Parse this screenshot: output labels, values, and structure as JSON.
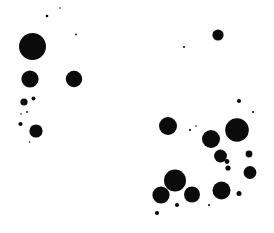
{
  "canvas": {
    "width": 274,
    "height": 233,
    "background_color": "#ffffff",
    "dot_color": "#0b0b0b"
  },
  "chart_data": {
    "type": "scatter",
    "title": "",
    "subtitle": "",
    "xlabel": "",
    "ylabel": "",
    "xlim": [
      0,
      274
    ],
    "ylim": [
      0,
      233
    ],
    "grid": false,
    "axes_visible": false,
    "tick_labels_x": [],
    "tick_labels_y": [],
    "legend": [],
    "annotations": [],
    "marker": "circle-filled",
    "marker_color": "#0b0b0b",
    "background_color": "#ffffff",
    "point_count": 35,
    "size_encoding": "radius_pixels",
    "series": [
      {
        "name": "dots",
        "color": "#0b0b0b",
        "points": [
          {
            "x": 32.5,
            "y": 46.5,
            "r": 13.5
          },
          {
            "x": 30.0,
            "y": 79.0,
            "r": 8.6
          },
          {
            "x": 74.0,
            "y": 79.0,
            "r": 8.2
          },
          {
            "x": 24.0,
            "y": 102.0,
            "r": 3.6
          },
          {
            "x": 33.5,
            "y": 98.5,
            "r": 2.0
          },
          {
            "x": 27.0,
            "y": 112.0,
            "r": 0.9
          },
          {
            "x": 21.0,
            "y": 114.0,
            "r": 0.8
          },
          {
            "x": 20.5,
            "y": 124.0,
            "r": 2.1
          },
          {
            "x": 36.0,
            "y": 131.0,
            "r": 6.6
          },
          {
            "x": 29.5,
            "y": 142.0,
            "r": 0.8
          },
          {
            "x": 47.0,
            "y": 16.0,
            "r": 1.3
          },
          {
            "x": 60.0,
            "y": 8.0,
            "r": 0.8
          },
          {
            "x": 76.0,
            "y": 34.5,
            "r": 0.9
          },
          {
            "x": 184.0,
            "y": 47.0,
            "r": 1.1
          },
          {
            "x": 218.0,
            "y": 35.0,
            "r": 5.6
          },
          {
            "x": 239.0,
            "y": 101.0,
            "r": 2.0
          },
          {
            "x": 253.0,
            "y": 112.0,
            "r": 1.0
          },
          {
            "x": 168.0,
            "y": 126.0,
            "r": 9.0
          },
          {
            "x": 190.0,
            "y": 130.0,
            "r": 1.1
          },
          {
            "x": 196.0,
            "y": 126.0,
            "r": 0.8
          },
          {
            "x": 211.0,
            "y": 139.0,
            "r": 9.0
          },
          {
            "x": 237.0,
            "y": 130.0,
            "r": 11.8
          },
          {
            "x": 220.5,
            "y": 156.0,
            "r": 6.4
          },
          {
            "x": 227.0,
            "y": 161.5,
            "r": 2.4
          },
          {
            "x": 228.0,
            "y": 168.0,
            "r": 2.6
          },
          {
            "x": 249.0,
            "y": 154.0,
            "r": 3.4
          },
          {
            "x": 250.0,
            "y": 172.5,
            "r": 6.4
          },
          {
            "x": 175.0,
            "y": 180.5,
            "r": 11.0
          },
          {
            "x": 161.0,
            "y": 195.0,
            "r": 8.6
          },
          {
            "x": 192.0,
            "y": 194.5,
            "r": 8.0
          },
          {
            "x": 221.5,
            "y": 190.5,
            "r": 9.0
          },
          {
            "x": 239.0,
            "y": 193.5,
            "r": 2.5
          },
          {
            "x": 177.0,
            "y": 205.0,
            "r": 2.0
          },
          {
            "x": 209.0,
            "y": 205.0,
            "r": 1.1
          },
          {
            "x": 157.0,
            "y": 213.0,
            "r": 2.1
          }
        ]
      }
    ]
  }
}
